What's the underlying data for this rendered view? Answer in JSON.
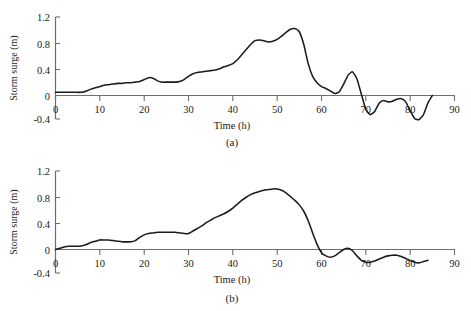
{
  "figure": {
    "panels": [
      {
        "id": "a",
        "caption": "(a)",
        "xlabel": "Time (h)",
        "ylabel": "Storm surge (m)"
      },
      {
        "id": "b",
        "caption": "(b)",
        "xlabel": "Time (h)",
        "ylabel": "Storm surge (m)"
      }
    ],
    "colors": {
      "series": "#1b1b1b",
      "axis": "#6e6e6e",
      "text": "#1a1a1a",
      "background": "#ffffff"
    }
  },
  "chart_data": [
    {
      "type": "line",
      "panel": "(a)",
      "title": "",
      "xlabel": "Time (h)",
      "ylabel": "Storm surge (m)",
      "xlim": [
        0,
        90
      ],
      "ylim": [
        -0.4,
        1.2
      ],
      "xticks": [
        0,
        10,
        20,
        30,
        40,
        50,
        60,
        70,
        80,
        90
      ],
      "yticks": [
        -0.4,
        0,
        0.4,
        0.8,
        1.2
      ],
      "xtick_labels": [
        "0",
        "10",
        "20",
        "30",
        "40",
        "50",
        "60",
        "70",
        "80",
        "90"
      ],
      "ytick_labels": [
        "-0.4",
        "0",
        "0.4",
        "0.8",
        "1.2"
      ],
      "grid": false,
      "legend": "none",
      "series": [
        {
          "name": "Storm surge",
          "x": [
            0,
            2,
            4,
            6,
            7,
            8,
            9,
            10,
            11,
            12,
            13,
            14,
            15,
            16,
            17,
            18,
            19,
            20,
            21,
            22,
            23,
            24,
            25,
            26,
            27,
            28,
            29,
            30,
            31,
            32,
            33,
            34,
            35,
            36,
            37,
            38,
            39,
            40,
            41,
            42,
            43,
            44,
            45,
            46,
            47,
            48,
            49,
            50,
            51,
            52,
            53,
            54,
            55,
            56,
            57,
            58,
            59,
            60,
            61,
            62,
            63,
            64,
            65,
            66,
            67,
            68,
            69,
            70,
            71,
            72,
            73,
            74,
            75,
            76,
            77,
            78,
            79,
            80,
            81,
            82,
            83,
            84,
            85
          ],
          "values": [
            0.05,
            0.05,
            0.05,
            0.05,
            0.07,
            0.1,
            0.12,
            0.14,
            0.16,
            0.17,
            0.18,
            0.19,
            0.19,
            0.2,
            0.2,
            0.21,
            0.22,
            0.25,
            0.28,
            0.27,
            0.23,
            0.21,
            0.21,
            0.21,
            0.21,
            0.22,
            0.25,
            0.3,
            0.34,
            0.36,
            0.37,
            0.38,
            0.39,
            0.4,
            0.42,
            0.45,
            0.47,
            0.5,
            0.56,
            0.64,
            0.72,
            0.8,
            0.86,
            0.87,
            0.86,
            0.84,
            0.85,
            0.88,
            0.93,
            0.99,
            1.04,
            1.05,
            1.0,
            0.8,
            0.5,
            0.3,
            0.2,
            0.14,
            0.11,
            0.07,
            0.03,
            0.06,
            0.18,
            0.32,
            0.37,
            0.26,
            0.02,
            -0.22,
            -0.3,
            -0.25,
            -0.12,
            -0.08,
            -0.1,
            -0.09,
            -0.06,
            -0.05,
            -0.1,
            -0.24,
            -0.36,
            -0.38,
            -0.3,
            -0.12,
            0.0
          ]
        }
      ]
    },
    {
      "type": "line",
      "panel": "(b)",
      "title": "",
      "xlabel": "Time (h)",
      "ylabel": "Storm surge (m)",
      "xlim": [
        0,
        90
      ],
      "ylim": [
        -0.4,
        1.2
      ],
      "xticks": [
        0,
        10,
        20,
        30,
        40,
        50,
        60,
        70,
        80,
        90
      ],
      "yticks": [
        -0.4,
        0,
        0.4,
        0.8,
        1.2
      ],
      "xtick_labels": [
        "0",
        "10",
        "20",
        "30",
        "40",
        "50",
        "60",
        "70",
        "80",
        "90"
      ],
      "ytick_labels": [
        "-0.4",
        "0",
        "0.4",
        "0.8",
        "1.2"
      ],
      "grid": false,
      "legend": "none",
      "series": [
        {
          "name": "Storm surge",
          "x": [
            0,
            1,
            2,
            3,
            4,
            5,
            6,
            7,
            8,
            9,
            10,
            11,
            12,
            13,
            14,
            15,
            16,
            17,
            18,
            19,
            20,
            21,
            22,
            23,
            24,
            25,
            26,
            27,
            28,
            29,
            30,
            31,
            32,
            33,
            34,
            35,
            36,
            37,
            38,
            39,
            40,
            41,
            42,
            43,
            44,
            45,
            46,
            47,
            48,
            49,
            50,
            51,
            52,
            53,
            54,
            55,
            56,
            57,
            58,
            59,
            60,
            61,
            62,
            63,
            64,
            65,
            66,
            67,
            68,
            69,
            70,
            71,
            72,
            73,
            74,
            75,
            76,
            77,
            78,
            79,
            80,
            81,
            82,
            83,
            84
          ],
          "values": [
            0.0,
            0.02,
            0.04,
            0.05,
            0.05,
            0.05,
            0.06,
            0.08,
            0.11,
            0.13,
            0.15,
            0.15,
            0.15,
            0.14,
            0.13,
            0.12,
            0.12,
            0.12,
            0.14,
            0.19,
            0.23,
            0.25,
            0.26,
            0.27,
            0.27,
            0.27,
            0.27,
            0.27,
            0.26,
            0.25,
            0.25,
            0.29,
            0.33,
            0.37,
            0.42,
            0.46,
            0.5,
            0.53,
            0.56,
            0.6,
            0.65,
            0.71,
            0.77,
            0.82,
            0.86,
            0.89,
            0.91,
            0.93,
            0.94,
            0.95,
            0.95,
            0.93,
            0.89,
            0.83,
            0.77,
            0.7,
            0.6,
            0.45,
            0.26,
            0.08,
            -0.05,
            -0.1,
            -0.12,
            -0.1,
            -0.05,
            0.0,
            0.02,
            -0.02,
            -0.1,
            -0.17,
            -0.2,
            -0.2,
            -0.18,
            -0.15,
            -0.12,
            -0.1,
            -0.09,
            -0.09,
            -0.11,
            -0.14,
            -0.17,
            -0.2,
            -0.21,
            -0.19,
            -0.17
          ]
        }
      ]
    }
  ]
}
